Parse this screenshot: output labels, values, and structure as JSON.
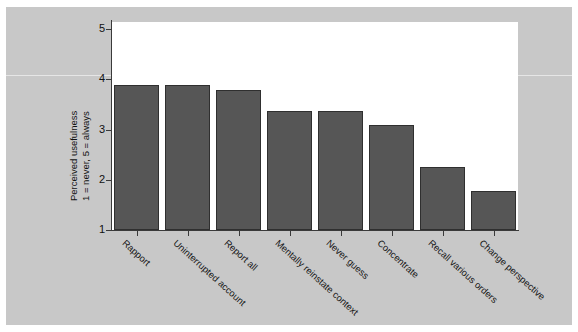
{
  "figure": {
    "background_color": "#c8c8c8",
    "plot_background_color": "#ffffff",
    "bar_color": "#565656",
    "bar_edge_color": "#2f2f2f",
    "axis_color": "#3a3a3a"
  },
  "chart_data": {
    "type": "bar",
    "title": "",
    "subtitle": "",
    "xlabel": "",
    "ylabel_line1": "Perceived usefulness",
    "ylabel_line2": "1 = never, 5 = always",
    "categories": [
      "Rapport",
      "Uninterrupted account",
      "Report all",
      "Mentally reinstate context",
      "Never guess",
      "Concentrate",
      "Recall various orders",
      "Change perspective"
    ],
    "values": [
      3.88,
      3.89,
      3.79,
      3.37,
      3.37,
      3.09,
      2.25,
      1.78
    ],
    "ylim": [
      1,
      5
    ],
    "yticks": [
      1,
      2,
      3,
      4,
      5
    ],
    "ytick_labels": [
      "1",
      "2",
      "3",
      "4",
      "5"
    ],
    "grid": false,
    "legend": null,
    "legend_position": "none",
    "annotations": []
  }
}
